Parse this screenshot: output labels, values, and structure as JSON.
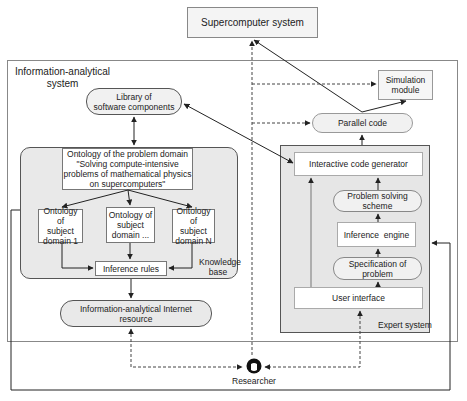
{
  "diagram": {
    "supercomputer": {
      "label": "Supercomputer system"
    },
    "info_system": {
      "title_line1": "Information-analytical",
      "title_line2": "system"
    },
    "library": {
      "line1": "Library of",
      "line2": "software components"
    },
    "knowledge_base": {
      "label_line1": "Knowledge",
      "label_line2": "base",
      "ontology_main": {
        "line1": "Ontology of the problem domain",
        "line2": "\"Solving compute-intensive",
        "line3": "problems of mathematical physics",
        "line4": "on supercomputers\""
      },
      "subdomains": [
        {
          "line1": "Ontology of",
          "line2": "subject",
          "line3": "domain 1"
        },
        {
          "line1": "Ontology of",
          "line2": "subject",
          "line3": "domain ..."
        },
        {
          "line1": "Ontology of",
          "line2": "subject",
          "line3": "domain N"
        }
      ],
      "inference_rules": "Inference rules"
    },
    "internet_resource": {
      "line1": "Information-analytical Internet",
      "line2": "resource"
    },
    "parallel_code": {
      "label": "Parallel code"
    },
    "simulation_module": {
      "line1": "Simulation",
      "line2": "module"
    },
    "expert_system": {
      "label": "Expert system",
      "code_generator": "Interactive code generator",
      "problem_solving": {
        "line1": "Problem solving",
        "line2": "scheme"
      },
      "inference_engine": "Inference  engine",
      "specification": {
        "line1": "Specification of",
        "line2": "problem"
      },
      "user_interface": "User interface"
    },
    "researcher": {
      "label": "Researcher",
      "icon": "person-head-icon"
    }
  }
}
